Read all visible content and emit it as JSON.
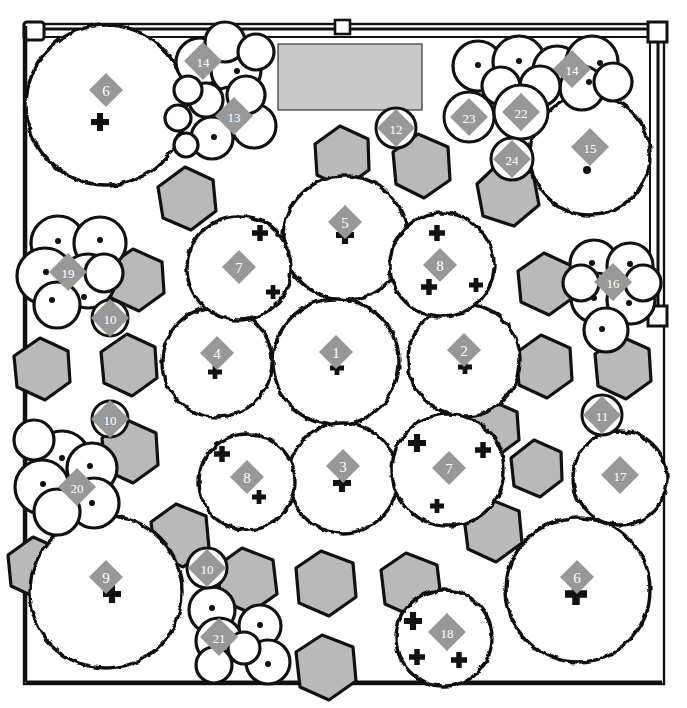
{
  "figure": {
    "kind": "forest-canopy-map",
    "plot_border": {
      "shape": "square",
      "corner_posts": 4,
      "gate_markers": [
        "top-left-post",
        "top-center-post",
        "top-right-post",
        "right-mid-post"
      ]
    },
    "colors": {
      "outline": "#111111",
      "canopy_fill": "#ffffff",
      "shrub_fill": "#b9b9b9",
      "building_fill": "#c8c8c8",
      "label_diamond": "#989898",
      "label_text": "#ffffff",
      "page_background": "#ffffff"
    },
    "legend_symbols": {
      "diamond": "numbered tree identifier",
      "plus": "stem position marker",
      "dot": "small stem marker",
      "circle_outline": "small isolated crown",
      "hexagon": "shrub / understory patch"
    }
  },
  "building": {
    "name": "building-footprint",
    "x": 278,
    "y": 44,
    "w": 144,
    "h": 66
  },
  "labels": [
    {
      "id": "6",
      "x": 106,
      "y": 90,
      "shape": "diamond"
    },
    {
      "id": "14",
      "x": 203,
      "y": 61,
      "shape": "diamond"
    },
    {
      "id": "13",
      "x": 234,
      "y": 116,
      "shape": "diamond"
    },
    {
      "id": "12",
      "x": 396,
      "y": 128,
      "shape": "diamond-circle"
    },
    {
      "id": "14",
      "x": 572,
      "y": 69,
      "shape": "diamond"
    },
    {
      "id": "23",
      "x": 469,
      "y": 117,
      "shape": "diamond-circle"
    },
    {
      "id": "22",
      "x": 521,
      "y": 112,
      "shape": "diamond-circle"
    },
    {
      "id": "24",
      "x": 512,
      "y": 159,
      "shape": "diamond-circle"
    },
    {
      "id": "15",
      "x": 590,
      "y": 147,
      "shape": "diamond"
    },
    {
      "id": "5",
      "x": 345,
      "y": 222,
      "shape": "diamond"
    },
    {
      "id": "7",
      "x": 239,
      "y": 267,
      "shape": "diamond"
    },
    {
      "id": "8",
      "x": 440,
      "y": 265,
      "shape": "diamond"
    },
    {
      "id": "19",
      "x": 68,
      "y": 272,
      "shape": "diamond"
    },
    {
      "id": "16",
      "x": 613,
      "y": 282,
      "shape": "diamond"
    },
    {
      "id": "10",
      "x": 110,
      "y": 318,
      "shape": "diamond-circle"
    },
    {
      "id": "4",
      "x": 217,
      "y": 353,
      "shape": "diamond"
    },
    {
      "id": "1",
      "x": 336,
      "y": 352,
      "shape": "diamond"
    },
    {
      "id": "2",
      "x": 464,
      "y": 350,
      "shape": "diamond"
    },
    {
      "id": "11",
      "x": 602,
      "y": 415,
      "shape": "diamond-circle"
    },
    {
      "id": "10",
      "x": 110,
      "y": 419,
      "shape": "diamond-circle"
    },
    {
      "id": "17",
      "x": 620,
      "y": 475,
      "shape": "diamond"
    },
    {
      "id": "20",
      "x": 77,
      "y": 487,
      "shape": "diamond"
    },
    {
      "id": "8",
      "x": 247,
      "y": 477,
      "shape": "diamond"
    },
    {
      "id": "3",
      "x": 343,
      "y": 466,
      "shape": "diamond"
    },
    {
      "id": "7",
      "x": 449,
      "y": 468,
      "shape": "diamond"
    },
    {
      "id": "9",
      "x": 106,
      "y": 577,
      "shape": "diamond"
    },
    {
      "id": "10",
      "x": 207,
      "y": 568,
      "shape": "diamond-circle"
    },
    {
      "id": "6",
      "x": 577,
      "y": 577,
      "shape": "diamond"
    },
    {
      "id": "21",
      "x": 219,
      "y": 637,
      "shape": "diamond"
    },
    {
      "id": "18",
      "x": 447,
      "y": 632,
      "shape": "diamond"
    }
  ],
  "stem_markers": [
    {
      "type": "plus",
      "x": 100,
      "y": 122,
      "size": 9
    },
    {
      "type": "plus",
      "x": 345,
      "y": 235,
      "size": 9
    },
    {
      "type": "plus",
      "x": 260,
      "y": 233,
      "size": 8
    },
    {
      "type": "plus",
      "x": 273,
      "y": 292,
      "size": 7
    },
    {
      "type": "plus",
      "x": 437,
      "y": 233,
      "size": 8
    },
    {
      "type": "plus",
      "x": 429,
      "y": 287,
      "size": 8
    },
    {
      "type": "plus",
      "x": 476,
      "y": 285,
      "size": 7
    },
    {
      "type": "plus",
      "x": 215,
      "y": 372,
      "size": 7
    },
    {
      "type": "plus",
      "x": 337,
      "y": 368,
      "size": 7
    },
    {
      "type": "plus",
      "x": 465,
      "y": 367,
      "size": 7
    },
    {
      "type": "plus",
      "x": 222,
      "y": 454,
      "size": 8
    },
    {
      "type": "plus",
      "x": 259,
      "y": 497,
      "size": 7
    },
    {
      "type": "plus",
      "x": 342,
      "y": 483,
      "size": 9
    },
    {
      "type": "plus",
      "x": 417,
      "y": 443,
      "size": 9
    },
    {
      "type": "plus",
      "x": 483,
      "y": 450,
      "size": 8
    },
    {
      "type": "plus",
      "x": 437,
      "y": 506,
      "size": 7
    },
    {
      "type": "plus",
      "x": 112,
      "y": 594,
      "size": 9
    },
    {
      "type": "plus",
      "x": 576,
      "y": 594,
      "size": 11
    },
    {
      "type": "plus",
      "x": 413,
      "y": 621,
      "size": 9
    },
    {
      "type": "plus",
      "x": 417,
      "y": 657,
      "size": 8
    },
    {
      "type": "plus",
      "x": 459,
      "y": 660,
      "size": 8
    },
    {
      "type": "dot",
      "x": 237,
      "y": 71,
      "size": 3
    },
    {
      "type": "dot",
      "x": 244,
      "y": 120,
      "size": 3
    },
    {
      "type": "dot",
      "x": 214,
      "y": 137,
      "size": 3
    },
    {
      "type": "dot",
      "x": 478,
      "y": 65,
      "size": 3
    },
    {
      "type": "dot",
      "x": 519,
      "y": 61,
      "size": 3
    },
    {
      "type": "dot",
      "x": 600,
      "y": 63,
      "size": 3
    },
    {
      "type": "dot",
      "x": 589,
      "y": 82,
      "size": 3
    },
    {
      "type": "dot",
      "x": 587,
      "y": 170,
      "size": 4
    },
    {
      "type": "dot",
      "x": 46,
      "y": 272,
      "size": 3
    },
    {
      "type": "dot",
      "x": 58,
      "y": 241,
      "size": 3
    },
    {
      "type": "dot",
      "x": 100,
      "y": 240,
      "size": 3
    },
    {
      "type": "dot",
      "x": 84,
      "y": 297,
      "size": 3
    },
    {
      "type": "dot",
      "x": 52,
      "y": 300,
      "size": 3
    },
    {
      "type": "dot",
      "x": 592,
      "y": 263,
      "size": 3
    },
    {
      "type": "dot",
      "x": 630,
      "y": 264,
      "size": 3
    },
    {
      "type": "dot",
      "x": 629,
      "y": 303,
      "size": 3
    },
    {
      "type": "dot",
      "x": 594,
      "y": 298,
      "size": 3
    },
    {
      "type": "dot",
      "x": 602,
      "y": 329,
      "size": 3
    },
    {
      "type": "dot",
      "x": 62,
      "y": 458,
      "size": 3
    },
    {
      "type": "dot",
      "x": 43,
      "y": 484,
      "size": 3
    },
    {
      "type": "dot",
      "x": 90,
      "y": 466,
      "size": 3
    },
    {
      "type": "dot",
      "x": 92,
      "y": 503,
      "size": 3
    },
    {
      "type": "dot",
      "x": 212,
      "y": 608,
      "size": 3
    },
    {
      "type": "dot",
      "x": 260,
      "y": 625,
      "size": 3
    },
    {
      "type": "dot",
      "x": 268,
      "y": 664,
      "size": 3
    }
  ],
  "counts": {
    "labeled_trees": 30,
    "distinct_ids": 24,
    "shrub_patches": 26
  }
}
